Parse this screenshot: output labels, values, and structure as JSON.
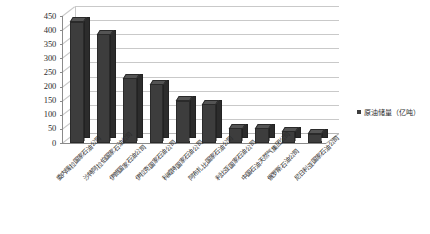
{
  "chart_data": {
    "type": "bar",
    "title": "",
    "xlabel": "",
    "ylabel": "",
    "ylim": [
      0,
      450
    ],
    "ytick_step": 50,
    "yticks": [
      "450",
      "400",
      "350",
      "300",
      "250",
      "200",
      "150",
      "100",
      "50",
      "0"
    ],
    "grid": true,
    "legend_position": "right",
    "legend": [
      "原油储量（亿吨）"
    ],
    "series_name": "原油储量（亿吨）",
    "bar_color": "#3d3d3d",
    "categories": [
      "委内瑞拉国家石油公司",
      "沙特阿拉伯国家石油公司",
      "伊朗国家石油公司",
      "伊拉克国家石油公司",
      "科威特国家石油公司",
      "阿布扎比国家石油公司",
      "利比亚国家石油公司",
      "中国石油天然气集团公司",
      "俄罗斯石油公司",
      "尼日利亚国家石油公司"
    ],
    "values": [
      430,
      385,
      230,
      208,
      150,
      138,
      52,
      52,
      42,
      32
    ]
  },
  "caption": {
    "text": ""
  }
}
